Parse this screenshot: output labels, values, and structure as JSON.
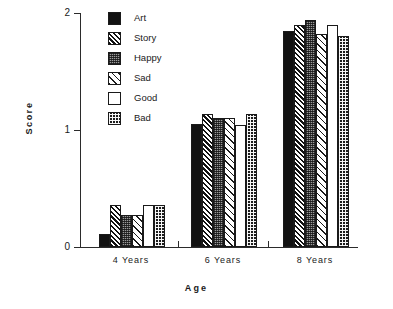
{
  "chart_data": {
    "type": "bar",
    "title": "",
    "subtitle": "",
    "xlabel": "Age",
    "ylabel": "Score",
    "categories": [
      "4 Years",
      "6 Years",
      "8 Years"
    ],
    "ylim": [
      0,
      2
    ],
    "yticks": [
      0,
      1,
      2
    ],
    "ytick_labels": [
      "0",
      "1",
      "2"
    ],
    "grid": false,
    "legend_position": "top-left-inside",
    "series": [
      {
        "name": "Art",
        "pattern": "solid-black",
        "values": [
          0.11,
          1.05,
          1.85
        ]
      },
      {
        "name": "Story",
        "pattern": "diagonal-hatch",
        "values": [
          0.36,
          1.14,
          1.9
        ]
      },
      {
        "name": "Happy",
        "pattern": "fine-dot-gray",
        "values": [
          0.27,
          1.1,
          1.94
        ]
      },
      {
        "name": "Sad",
        "pattern": "light-diagonal",
        "values": [
          0.27,
          1.1,
          1.82
        ]
      },
      {
        "name": "Good",
        "pattern": "empty-white",
        "values": [
          0.36,
          1.04,
          1.9
        ]
      },
      {
        "name": "Bad",
        "pattern": "coarse-checker",
        "values": [
          0.36,
          1.14,
          1.8
        ]
      }
    ]
  },
  "axes": {
    "y_title": "Score",
    "x_title": "Age",
    "y_tick_labels": [
      "2",
      "1",
      "0"
    ],
    "x_tick_labels": [
      "4 Years",
      "6 Years",
      "8 Years"
    ]
  },
  "legend": {
    "items": [
      {
        "label": "Art"
      },
      {
        "label": "Story"
      },
      {
        "label": "Happy"
      },
      {
        "label": "Sad"
      },
      {
        "label": "Good"
      },
      {
        "label": "Bad"
      }
    ]
  },
  "colors": {
    "axis": "#2b2b2b",
    "ink": "#121212",
    "gray_fill": "#9a9a9a",
    "background": "#ffffff"
  }
}
